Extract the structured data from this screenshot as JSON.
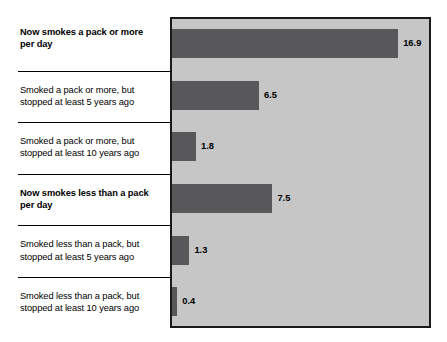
{
  "chart_data": {
    "type": "bar",
    "orientation": "horizontal",
    "title": "",
    "xlabel": "",
    "ylabel": "",
    "categories": [
      "Now smokes a pack or more per day",
      "Smoked a pack or more, but stopped at least 5 years ago",
      "Smoked a pack or more, but stopped at least 10 years ago",
      "Now smokes less than a pack per day",
      "Smoked less than a pack, but stopped at least 5 years ago",
      "Smoked less than a pack, but stopped at least 10 years ago"
    ],
    "values": [
      16.9,
      6.5,
      1.8,
      7.5,
      1.3,
      0.4
    ],
    "xlim": [
      0,
      19.2
    ],
    "grid": false,
    "legend": null,
    "colors": {
      "bar_fill": "#58585a",
      "plot_background": "#c6c6c6",
      "plot_border": "#1a1a1a",
      "page_background": "#ffffff",
      "text": "#000000"
    }
  },
  "rows": [
    {
      "label_line1": "Now smokes a pack or more",
      "label_line2": "per day",
      "value": "16.9",
      "bold": true,
      "divider": false
    },
    {
      "label_line1": "Smoked a pack or more, but",
      "label_line2": "stopped at least 5 years ago",
      "value": "6.5",
      "bold": false,
      "divider": true
    },
    {
      "label_line1": "Smoked a pack or more, but",
      "label_line2": "stopped at least 10 years ago",
      "value": "1.8",
      "bold": false,
      "divider": true
    },
    {
      "label_line1": "Now smokes less than a pack",
      "label_line2": "per day",
      "value": "7.5",
      "bold": true,
      "divider": true
    },
    {
      "label_line1": "Smoked less than a pack, but",
      "label_line2": "stopped at least 5 years ago",
      "value": "1.3",
      "bold": false,
      "divider": true
    },
    {
      "label_line1": "Smoked less than a pack, but",
      "label_line2": "stopped at least 10 years ago",
      "value": "0.4",
      "bold": false,
      "divider": true
    }
  ]
}
